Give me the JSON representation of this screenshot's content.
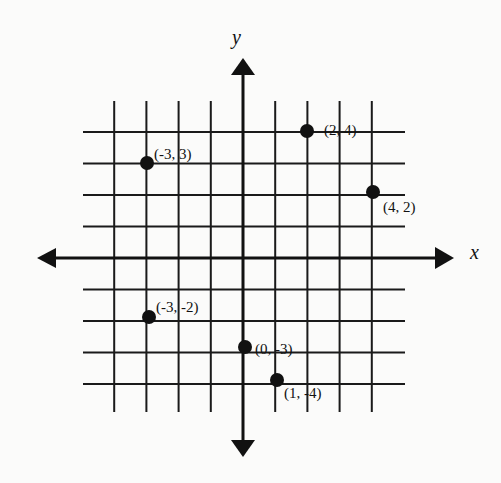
{
  "chart_data": {
    "type": "scatter",
    "title": "",
    "xlabel": "x",
    "ylabel": "y",
    "xlim": [
      -4,
      5
    ],
    "ylim": [
      -5,
      4
    ],
    "grid": true,
    "grid_x": [
      -4,
      -3,
      -2,
      -1,
      0,
      1,
      2,
      3,
      4
    ],
    "grid_y": [
      4,
      3,
      2,
      1,
      0,
      -1,
      -2,
      -3,
      -4
    ],
    "points": [
      {
        "x": -3,
        "y": 3,
        "label": "(-3, 3)"
      },
      {
        "x": 2,
        "y": 4,
        "label": "(2, 4)"
      },
      {
        "x": 4,
        "y": 2,
        "label": "(4, 2)"
      },
      {
        "x": -3,
        "y": -2,
        "label": "(-3, -2)"
      },
      {
        "x": 0,
        "y": -3,
        "label": "(0, -3)"
      },
      {
        "x": 1,
        "y": -4,
        "label": "(1, -4)"
      }
    ]
  },
  "axes": {
    "x_label": "x",
    "y_label": "y"
  },
  "colors": {
    "ink": "#111111",
    "background": "#fbfbfa"
  }
}
